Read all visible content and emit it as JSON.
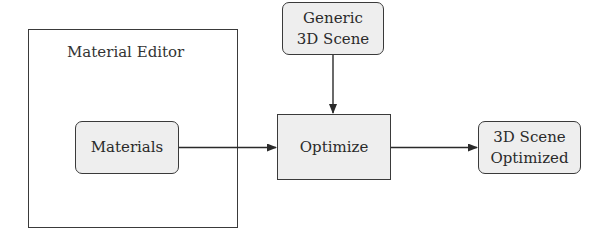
{
  "diagram": {
    "type": "flowchart",
    "groups": [
      {
        "id": "material-editor",
        "label": "Material Editor",
        "contains": [
          "materials"
        ]
      }
    ],
    "nodes": [
      {
        "id": "materials",
        "lines": [
          "Materials"
        ],
        "shape": "rounded"
      },
      {
        "id": "generic-scene",
        "lines": [
          "Generic",
          "3D Scene"
        ],
        "shape": "rounded"
      },
      {
        "id": "optimize",
        "lines": [
          "Optimize"
        ],
        "shape": "rectangle"
      },
      {
        "id": "scene-optimized",
        "lines": [
          "3D Scene",
          "Optimized"
        ],
        "shape": "rounded"
      }
    ],
    "edges": [
      {
        "from": "materials",
        "to": "optimize"
      },
      {
        "from": "generic-scene",
        "to": "optimize"
      },
      {
        "from": "optimize",
        "to": "scene-optimized"
      }
    ]
  },
  "labels": {
    "group_material_editor": "Material Editor",
    "materials": "Materials",
    "generic_line1": "Generic",
    "generic_line2": "3D Scene",
    "optimize": "Optimize",
    "output_line1": "3D Scene",
    "output_line2": "Optimized"
  },
  "colors": {
    "stroke": "#3a3a3a",
    "node_fill": "#eeeeee",
    "background": "#ffffff"
  }
}
